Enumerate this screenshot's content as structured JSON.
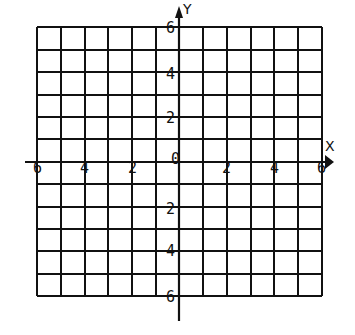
{
  "diagram": {
    "type": "coordinate-grid",
    "x_axis": {
      "label": "X",
      "min": -6,
      "max": 6,
      "ticks": [
        "-6",
        "-4",
        "-2",
        "0",
        "2",
        "4",
        "6"
      ]
    },
    "y_axis": {
      "label": "Y",
      "min": -6,
      "max": 6,
      "ticks": [
        "6",
        "4",
        "2",
        "-2",
        "-4",
        "-6"
      ]
    },
    "grid": {
      "columns": 12,
      "rows": 12,
      "step": 1
    },
    "labels": {
      "x_neg6": "6",
      "x_neg4": "4",
      "x_neg2": "2",
      "origin": "0",
      "x_2": "2",
      "x_4": "4",
      "x_6": "6",
      "y_6": "6",
      "y_4": "4",
      "y_2": "2",
      "y_neg2": "2",
      "y_neg4": "4",
      "y_neg6": "6",
      "x_title": "X",
      "y_title": "Y"
    },
    "colors": {
      "line": "#111111",
      "background": "#ffffff"
    }
  }
}
